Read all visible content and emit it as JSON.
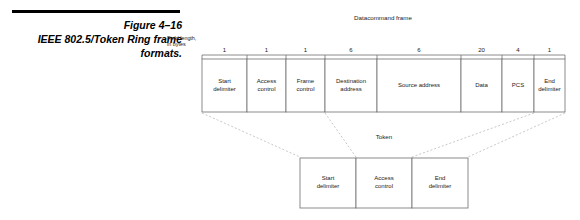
{
  "caption": {
    "figure_number": "Figure 4–16",
    "title_line1": "IEEE 802.5/Token Ring frame",
    "title_line2": "formats."
  },
  "field_note": {
    "line1": "Field length,",
    "line2": "in bytes"
  },
  "main_frame": {
    "title": "Datacommand frame",
    "fields": [
      {
        "length": "1",
        "label_line1": "Start",
        "label_line2": "delimiter",
        "width": 45
      },
      {
        "length": "1",
        "label_line1": "Access",
        "label_line2": "control",
        "width": 39
      },
      {
        "length": "1",
        "label_line1": "Frame",
        "label_line2": "control",
        "width": 39
      },
      {
        "length": "6",
        "label_line1": "Destination",
        "label_line2": "address",
        "width": 52
      },
      {
        "length": "6",
        "label_line1": "Source address",
        "label_line2": "",
        "width": 84
      },
      {
        "length": "20",
        "label_line1": "Data",
        "label_line2": "",
        "width": 41
      },
      {
        "length": "4",
        "label_line1": "PCS",
        "label_line2": "",
        "width": 32
      },
      {
        "length": "1",
        "label_line1": "End",
        "label_line2": "delimiter",
        "width": 31
      }
    ]
  },
  "token_frame": {
    "title": "Token",
    "fields": [
      {
        "label_line1": "Start",
        "label_line2": "delimiter"
      },
      {
        "label_line1": "Access",
        "label_line2": "control"
      },
      {
        "label_line1": "End",
        "label_line2": "delimiter"
      }
    ]
  },
  "colors": {
    "rule": "#000000",
    "box_stroke": "#6e6e6e",
    "projection": "#b0b0b0",
    "text": "#1a1a1a",
    "background": "#ffffff"
  }
}
